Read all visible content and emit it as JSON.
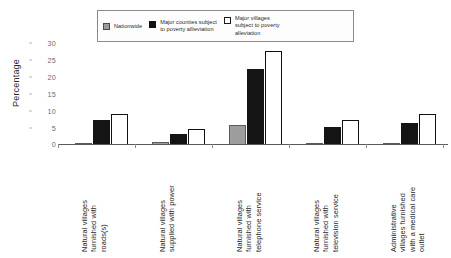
{
  "chart": {
    "type": "bar",
    "title": "",
    "ylabel": "Percentage",
    "xlabel": "",
    "legend_position": "top-center",
    "grid": false
  },
  "legend": {
    "entries": [
      {
        "label": "Nationwide",
        "swatch": "gray",
        "color": "#9d9d9d"
      },
      {
        "label": "Major counties subject\nto poverty allieviation",
        "swatch": "black",
        "color": "#141414"
      },
      {
        "label": "Major villages\nsubject to poverty\nalleviation",
        "swatch": "white",
        "color": "#ffffff"
      }
    ]
  },
  "yaxis": {
    "ticks": [
      "30",
      "25",
      "20",
      "15",
      "10",
      "5",
      "0"
    ],
    "min": 0,
    "max": 30
  },
  "categories": [
    "Natural villages\nfurnished with\nroads(s)",
    "Natural villages\nsupplied with power",
    "Natural villages\nfurnished with\ntelephone service",
    "Natural villages\nfurnished with\ntelevision service",
    "Administrative\nvillages  furnished\nwith a medical care\noutlet"
  ],
  "chart_data": {
    "type": "bar",
    "title": "",
    "xlabel": "",
    "ylabel": "Percentage",
    "ylim": [
      0,
      30
    ],
    "yticks": [
      0,
      5,
      10,
      15,
      20,
      25,
      30
    ],
    "grid": false,
    "legend": "top-center",
    "categories": [
      "Natural villages furnished with roads(s)",
      "Natural villages supplied with power",
      "Natural villages furnished with telephone service",
      "Natural villages furnished with television service",
      "Administrative villages furnished with a medical care outlet"
    ],
    "series": [
      {
        "name": "Nationwide",
        "color": "#9d9d9d",
        "values": [
          0.4,
          0.7,
          5.5,
          0.2,
          0.2
        ]
      },
      {
        "name": "Major counties subject to poverty allieviation",
        "color": "#141414",
        "values": [
          7.0,
          3.0,
          21.5,
          5.0,
          6.0
        ]
      },
      {
        "name": "Major villages subject to poverty alleviation",
        "color": "#ffffff",
        "values": [
          8.5,
          4.3,
          26.5,
          7.0,
          8.5
        ]
      }
    ]
  }
}
